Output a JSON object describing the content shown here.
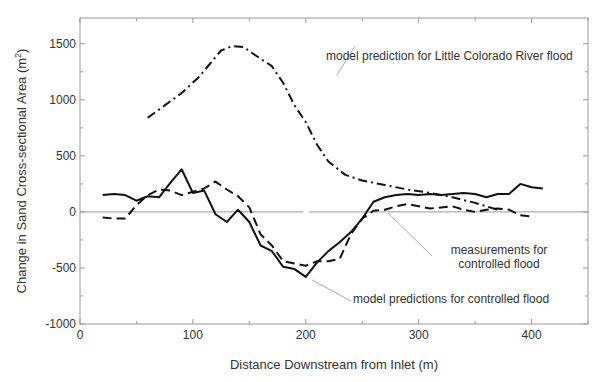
{
  "chart_data": {
    "type": "line",
    "title": "",
    "xlabel": "Distance Downstream from Inlet (m)",
    "ylabel": "Change in Sand Cross-sectional Area (m²)",
    "ylabel_base": "Change in Sand Cross-sectional Area (m",
    "ylabel_sup": "2",
    "ylabel_close": ")",
    "xlim": [
      0,
      450
    ],
    "ylim": [
      -1000,
      1730
    ],
    "xticks": [
      0,
      100,
      200,
      300,
      400
    ],
    "xtick_labels": [
      "0",
      "100",
      "200",
      "300",
      "400"
    ],
    "yticks": [
      -1000,
      -500,
      0,
      500,
      1000,
      1500
    ],
    "ytick_labels": [
      "-1000",
      "-500",
      "0",
      "500",
      "1000",
      "1500"
    ],
    "grid": false,
    "zero_line": true,
    "series": [
      {
        "name": "model prediction for Little Colorado River flood",
        "style": "dashdot",
        "x": [
          60,
          75,
          90,
          105,
          115,
          125,
          135,
          145,
          155,
          170,
          180,
          190,
          200,
          210,
          220,
          235,
          250,
          270,
          290,
          310,
          330,
          350,
          370
        ],
        "y": [
          840,
          950,
          1060,
          1200,
          1320,
          1440,
          1480,
          1470,
          1400,
          1300,
          1150,
          950,
          800,
          600,
          450,
          330,
          280,
          240,
          200,
          170,
          130,
          80,
          20
        ]
      },
      {
        "name": "model predictions for controlled flood",
        "style": "solid",
        "x": [
          20,
          30,
          40,
          50,
          60,
          70,
          80,
          90,
          100,
          110,
          120,
          130,
          140,
          150,
          160,
          170,
          180,
          190,
          200,
          210,
          220,
          230,
          240,
          250,
          260,
          270,
          280,
          290,
          300,
          310,
          320,
          330,
          340,
          350,
          360,
          370,
          380,
          390,
          400,
          410
        ],
        "y": [
          150,
          160,
          150,
          100,
          140,
          130,
          260,
          380,
          170,
          190,
          -20,
          -90,
          20,
          -90,
          -300,
          -350,
          -490,
          -510,
          -580,
          -450,
          -350,
          -270,
          -180,
          -60,
          90,
          130,
          150,
          160,
          150,
          160,
          150,
          160,
          170,
          160,
          130,
          160,
          160,
          250,
          220,
          210
        ]
      },
      {
        "name": "measurements for controlled flood",
        "style": "dashed",
        "x": [
          20,
          30,
          40,
          50,
          60,
          70,
          80,
          90,
          100,
          110,
          120,
          130,
          140,
          150,
          160,
          170,
          180,
          190,
          200,
          210,
          220,
          230,
          240,
          250,
          260,
          270,
          280,
          290,
          300,
          310,
          320,
          330,
          340,
          350,
          360,
          370,
          380,
          390,
          400
        ],
        "y": [
          -50,
          -60,
          -60,
          60,
          150,
          200,
          190,
          150,
          180,
          210,
          270,
          200,
          140,
          40,
          -200,
          -300,
          -440,
          -460,
          -480,
          -440,
          -440,
          -420,
          -200,
          -60,
          10,
          20,
          50,
          70,
          50,
          30,
          40,
          50,
          20,
          0,
          20,
          30,
          20,
          -30,
          -40
        ]
      }
    ],
    "annotations": [
      {
        "text": "model prediction for Little Colorado River flood",
        "anchor_x": 240,
        "anchor_y": 1000
      },
      {
        "text": "measurements for controlled flood",
        "anchor_x": 270,
        "anchor_y": 50
      },
      {
        "text": "model predictions for controlled flood",
        "anchor_x": 205,
        "anchor_y": -600
      }
    ],
    "legend": "inline annotations"
  },
  "labels": {
    "ann_lcr": "model prediction for Little Colorado River flood",
    "ann_meas_1": "measurements for",
    "ann_meas_2": "controlled flood",
    "ann_model": "model predictions for controlled flood"
  }
}
